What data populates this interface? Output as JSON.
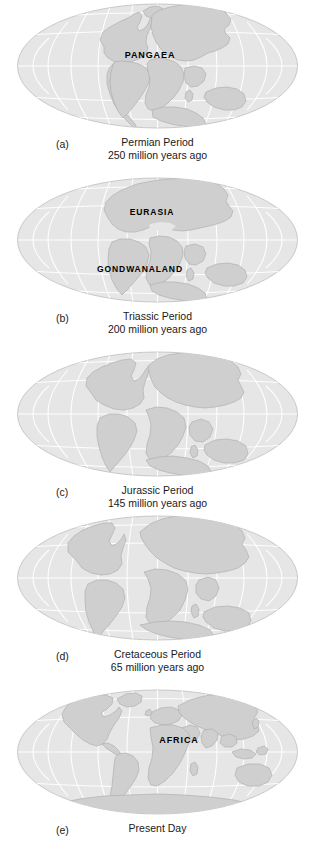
{
  "figure": {
    "background_color": "#ffffff",
    "ocean_color": "#e6e6e6",
    "ocean_edge_color": "#c9c9c9",
    "land_color": "#cfcfcf",
    "land_edge_color": "#b0b0b0",
    "graticule_color": "#ffffff",
    "text_color": "#1a1a1a",
    "label_color": "#000000"
  },
  "panels": [
    {
      "letter": "(a)",
      "period": "Permian Period",
      "age": "250 million years ago",
      "map_labels": [
        {
          "text": "PANGAEA",
          "x": 150,
          "y": 58,
          "size": 9
        }
      ]
    },
    {
      "letter": "(b)",
      "period": "Triassic Period",
      "age": "200 million years ago",
      "map_labels": [
        {
          "text": "EURASIA",
          "x": 152,
          "y": 41,
          "size": 8.5
        },
        {
          "text": "GONDWANALAND",
          "x": 140,
          "y": 98,
          "size": 8.5
        }
      ]
    },
    {
      "letter": "(c)",
      "period": "Jurassic Period",
      "age": "145 million years ago",
      "map_labels": []
    },
    {
      "letter": "(d)",
      "period": "Cretaceous Period",
      "age": "65 million years ago",
      "map_labels": []
    },
    {
      "letter": "(e)",
      "period": "Present Day",
      "age": "",
      "map_labels": [
        {
          "text": "AFRICA",
          "x": 179,
          "y": 57,
          "size": 9
        }
      ]
    }
  ]
}
